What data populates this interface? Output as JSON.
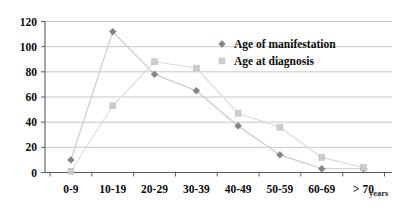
{
  "chart_data": {
    "type": "line",
    "title": "",
    "xlabel": "years",
    "ylabel": "",
    "categories": [
      "0-9",
      "10-19",
      "20-29",
      "30-39",
      "40-49",
      "50-59",
      "60-69",
      "> 70"
    ],
    "series": [
      {
        "name": "Age of manifestation",
        "marker": "diamond",
        "color": "#8c7f87",
        "values": [
          10,
          112,
          78,
          65,
          37,
          14,
          3,
          3
        ]
      },
      {
        "name": "Age at diagnosis",
        "marker": "square",
        "color": "#cccccc",
        "values": [
          1,
          53,
          88,
          83,
          47,
          36,
          12,
          4
        ]
      }
    ],
    "ylim": [
      0,
      120
    ],
    "yticks": [
      0,
      20,
      40,
      60,
      80,
      100,
      120
    ],
    "ytick_labels": [
      "0",
      "20",
      "40",
      "60",
      "80",
      "100",
      "120"
    ],
    "grid": true,
    "legend_position": "upper-right-inside"
  },
  "legend": {
    "items": [
      {
        "label": "Age of manifestation",
        "marker": "diamond-marker",
        "color": "#8c7f87"
      },
      {
        "label": "Age at diagnosis",
        "marker": "square-marker",
        "color": "#cccccc"
      }
    ]
  },
  "axis": {
    "x_unit_label": "years"
  }
}
